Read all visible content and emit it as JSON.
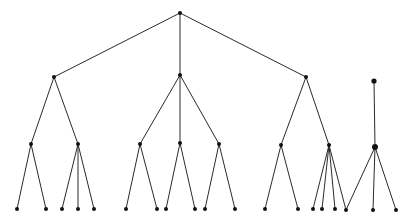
{
  "diagram": {
    "type": "tree",
    "colors": {
      "edge": "#2a2a2a",
      "node": "#111111",
      "background": "#ffffff"
    },
    "nodes": [
      {
        "id": "root",
        "x": 180,
        "y": 13,
        "r": 2
      },
      {
        "id": "a",
        "x": 54,
        "y": 77,
        "r": 2
      },
      {
        "id": "b",
        "x": 180,
        "y": 75,
        "r": 2
      },
      {
        "id": "c",
        "x": 306,
        "y": 77,
        "r": 2
      },
      {
        "id": "d",
        "x": 374,
        "y": 81,
        "r": 2.6
      },
      {
        "id": "a1",
        "x": 31,
        "y": 144,
        "r": 2
      },
      {
        "id": "a2",
        "x": 78,
        "y": 144,
        "r": 2
      },
      {
        "id": "b1",
        "x": 140,
        "y": 144,
        "r": 2
      },
      {
        "id": "b2",
        "x": 180,
        "y": 143,
        "r": 2
      },
      {
        "id": "b3",
        "x": 219,
        "y": 144,
        "r": 2
      },
      {
        "id": "c1",
        "x": 281,
        "y": 145,
        "r": 2
      },
      {
        "id": "c2",
        "x": 329,
        "y": 145,
        "r": 2
      },
      {
        "id": "d1",
        "x": 375,
        "y": 147,
        "r": 3
      },
      {
        "id": "l1",
        "x": 17,
        "y": 209,
        "r": 2
      },
      {
        "id": "l2",
        "x": 46,
        "y": 209,
        "r": 2
      },
      {
        "id": "l3",
        "x": 62,
        "y": 209,
        "r": 2
      },
      {
        "id": "l4",
        "x": 78,
        "y": 209,
        "r": 2
      },
      {
        "id": "l5",
        "x": 94,
        "y": 209,
        "r": 2
      },
      {
        "id": "l6",
        "x": 126,
        "y": 209,
        "r": 2
      },
      {
        "id": "l7",
        "x": 157,
        "y": 209,
        "r": 2
      },
      {
        "id": "l8",
        "x": 166,
        "y": 209,
        "r": 2
      },
      {
        "id": "l9",
        "x": 195,
        "y": 209,
        "r": 2
      },
      {
        "id": "l10",
        "x": 205,
        "y": 209,
        "r": 2
      },
      {
        "id": "l11",
        "x": 235,
        "y": 209,
        "r": 2
      },
      {
        "id": "l12",
        "x": 265,
        "y": 209,
        "r": 2
      },
      {
        "id": "l13",
        "x": 298,
        "y": 209,
        "r": 2
      },
      {
        "id": "l14",
        "x": 313,
        "y": 209,
        "r": 2
      },
      {
        "id": "l15",
        "x": 322,
        "y": 209,
        "r": 2
      },
      {
        "id": "l16",
        "x": 335,
        "y": 209,
        "r": 2
      },
      {
        "id": "l17",
        "x": 346,
        "y": 210,
        "r": 2
      },
      {
        "id": "l18",
        "x": 373,
        "y": 210,
        "r": 2
      },
      {
        "id": "l19",
        "x": 396,
        "y": 210,
        "r": 2
      }
    ],
    "edges": [
      [
        "root",
        "a"
      ],
      [
        "root",
        "b"
      ],
      [
        "root",
        "c"
      ],
      [
        "a",
        "a1"
      ],
      [
        "a",
        "a2"
      ],
      [
        "b",
        "b1"
      ],
      [
        "b",
        "b2"
      ],
      [
        "b",
        "b3"
      ],
      [
        "c",
        "c1"
      ],
      [
        "c",
        "c2"
      ],
      [
        "d",
        "d1"
      ],
      [
        "a1",
        "l1"
      ],
      [
        "a1",
        "l2"
      ],
      [
        "a2",
        "l3"
      ],
      [
        "a2",
        "l4"
      ],
      [
        "a2",
        "l5"
      ],
      [
        "b1",
        "l6"
      ],
      [
        "b1",
        "l7"
      ],
      [
        "b2",
        "l8"
      ],
      [
        "b2",
        "l9"
      ],
      [
        "b3",
        "l10"
      ],
      [
        "b3",
        "l11"
      ],
      [
        "c1",
        "l12"
      ],
      [
        "c1",
        "l13"
      ],
      [
        "c2",
        "l14"
      ],
      [
        "c2",
        "l15"
      ],
      [
        "c2",
        "l16"
      ],
      [
        "c2",
        "l17"
      ],
      [
        "d1",
        "l17"
      ],
      [
        "d1",
        "l18"
      ],
      [
        "d1",
        "l19"
      ]
    ]
  }
}
